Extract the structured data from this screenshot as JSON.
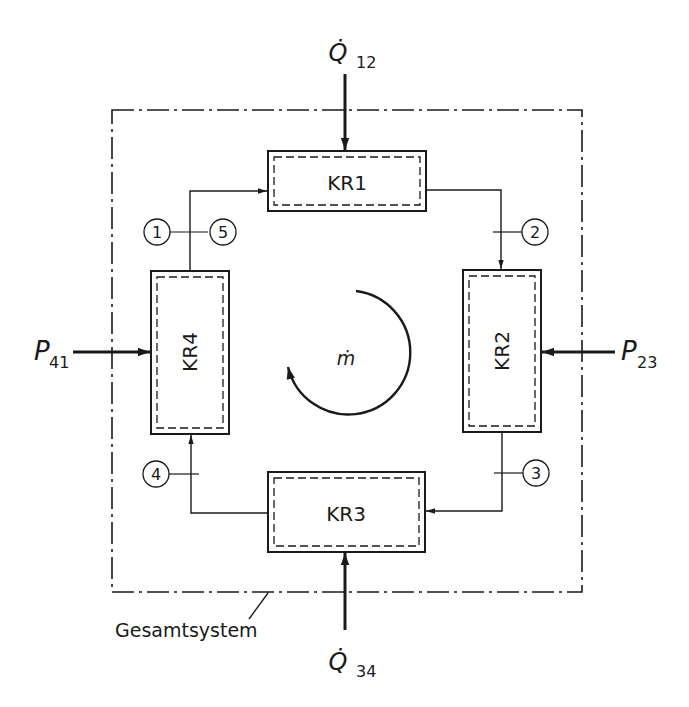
{
  "diagram": {
    "type": "thermodynamic cycle block diagram",
    "system_boundary_label": "Gesamtsystem",
    "center_label": "ṁ",
    "components": [
      {
        "id": "kr1",
        "label": "KR1"
      },
      {
        "id": "kr2",
        "label": "KR2"
      },
      {
        "id": "kr3",
        "label": "KR3"
      },
      {
        "id": "kr4",
        "label": "KR4"
      }
    ],
    "state_points": [
      "1",
      "2",
      "3",
      "4",
      "5"
    ],
    "inputs": {
      "q12": {
        "symbol": "Q̇",
        "sub": "12"
      },
      "q34": {
        "symbol": "Q̇",
        "sub": "34"
      },
      "p23": {
        "symbol": "P",
        "sub": "23"
      },
      "p41": {
        "symbol": "P",
        "sub": "41"
      }
    },
    "colors": {
      "line": "#1a1a1a",
      "background": "#ffffff"
    }
  }
}
